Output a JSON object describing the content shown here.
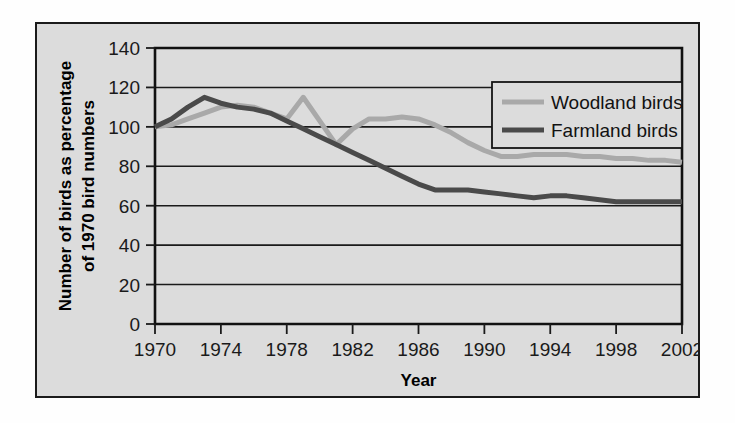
{
  "chart_data": {
    "type": "line",
    "title": "",
    "xlabel": "Year",
    "ylabel": "Number of birds as percentage of 1970 bird numbers",
    "ylabel_line1": "Number of birds as percentage",
    "ylabel_line2": "of 1970 bird numbers",
    "xlim": [
      1970,
      2002
    ],
    "ylim": [
      0,
      140
    ],
    "grid": true,
    "legend_position": "top-right",
    "xticks": [
      1970,
      1974,
      1978,
      1982,
      1986,
      1990,
      1994,
      1998,
      2002
    ],
    "xtick_labels": [
      "1970",
      "1974",
      "1978",
      "1982",
      "1986",
      "1990",
      "1994",
      "1998",
      "2002"
    ],
    "yticks": [
      0,
      20,
      40,
      60,
      80,
      100,
      120,
      140
    ],
    "ytick_labels": [
      "0",
      "20",
      "40",
      "60",
      "80",
      "100",
      "120",
      "140"
    ],
    "x": [
      1970,
      1971,
      1972,
      1973,
      1974,
      1975,
      1976,
      1977,
      1978,
      1979,
      1980,
      1981,
      1982,
      1983,
      1984,
      1985,
      1986,
      1987,
      1988,
      1989,
      1990,
      1991,
      1992,
      1993,
      1994,
      1995,
      1996,
      1997,
      1998,
      1999,
      2000,
      2001,
      2002
    ],
    "series": [
      {
        "name": "Woodland birds",
        "color": "#a9a9a9",
        "values": [
          100,
          101,
          104,
          107,
          110,
          111,
          110,
          107,
          104,
          115,
          103,
          91,
          99,
          104,
          104,
          105,
          104,
          101,
          97,
          92,
          88,
          85,
          85,
          86,
          86,
          86,
          85,
          85,
          84,
          84,
          83,
          83,
          82
        ]
      },
      {
        "name": "Farmland birds",
        "color": "#4a4a4a",
        "values": [
          100,
          104,
          110,
          115,
          112,
          110,
          109,
          107,
          103,
          99,
          95,
          91,
          87,
          83,
          79,
          75,
          71,
          68,
          68,
          68,
          67,
          66,
          65,
          64,
          65,
          65,
          64,
          63,
          62,
          62,
          62,
          62,
          62
        ]
      }
    ]
  },
  "legend": {
    "entries": [
      {
        "label": "Woodland birds",
        "color": "#a9a9a9"
      },
      {
        "label": "Farmland birds",
        "color": "#4a4a4a"
      }
    ]
  },
  "axes": {
    "x_title": "Year",
    "y_title_line1": "Number of birds as percentage",
    "y_title_line2": "of 1970 bird numbers"
  }
}
